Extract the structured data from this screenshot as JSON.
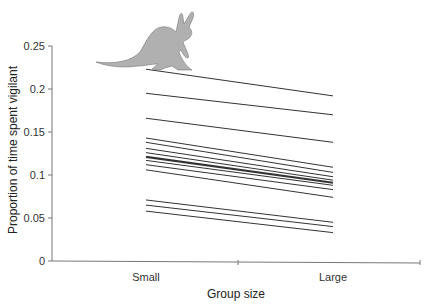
{
  "chart_data": {
    "type": "line",
    "title": "",
    "xlabel": "Group size",
    "ylabel": "Proportion of time spent vigilant",
    "categories": [
      "Small",
      "Large"
    ],
    "ylim": [
      0,
      0.25
    ],
    "yticks": [
      "0",
      "0.05",
      "0.1",
      "0.15",
      "0.2",
      "0.25"
    ],
    "grid": false,
    "legend": "none",
    "decoration": "kangaroo illustration above top-left of plot",
    "series": [
      {
        "name": "1",
        "values": [
          0.223,
          0.192
        ]
      },
      {
        "name": "2",
        "values": [
          0.195,
          0.17
        ]
      },
      {
        "name": "3",
        "values": [
          0.166,
          0.138
        ]
      },
      {
        "name": "4",
        "values": [
          0.143,
          0.109
        ]
      },
      {
        "name": "5",
        "values": [
          0.138,
          0.103
        ]
      },
      {
        "name": "6",
        "values": [
          0.131,
          0.098
        ]
      },
      {
        "name": "7",
        "values": [
          0.126,
          0.094
        ]
      },
      {
        "name": "8",
        "values": [
          0.121,
          0.091
        ],
        "bold": true
      },
      {
        "name": "9",
        "values": [
          0.117,
          0.088
        ]
      },
      {
        "name": "10",
        "values": [
          0.112,
          0.083
        ]
      },
      {
        "name": "11",
        "values": [
          0.106,
          0.074
        ]
      },
      {
        "name": "12",
        "values": [
          0.071,
          0.045
        ]
      },
      {
        "name": "13",
        "values": [
          0.065,
          0.04
        ]
      },
      {
        "name": "14",
        "values": [
          0.058,
          0.033
        ]
      }
    ]
  },
  "colors": {
    "line": "#333333",
    "axis": "#777777",
    "kangaroo": "#a8a8a8"
  }
}
